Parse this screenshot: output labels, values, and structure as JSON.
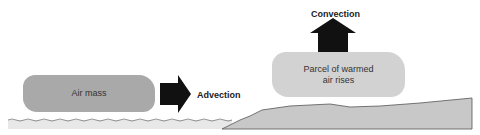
{
  "diagram": {
    "air_mass": {
      "label": "Air mass",
      "color": "#a9a9a9"
    },
    "advection": {
      "label": "Advection",
      "arrow_direction": "right",
      "arrow_color": "#111111"
    },
    "parcel": {
      "label_line1": "Parcel of warmed",
      "label_line2": "air rises",
      "color": "#d2d2d2"
    },
    "convection": {
      "label": "Convection",
      "arrow_direction": "up",
      "arrow_color": "#111111"
    },
    "surfaces": {
      "water_color": "#e6e6e6",
      "land_color": "#c8c8c8"
    }
  }
}
